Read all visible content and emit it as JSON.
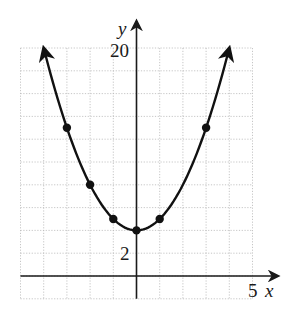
{
  "chart_data": {
    "type": "line",
    "title": "",
    "function": "y = x^2 + 4",
    "xlabel": "x",
    "ylabel": "y",
    "xlim": [
      -5,
      5
    ],
    "ylim": [
      -2,
      20
    ],
    "grid": true,
    "grid_style": "dotted",
    "x_grid_step": 1,
    "y_grid_step": 2,
    "tick_labels": {
      "x": [
        {
          "value": 5,
          "label": "5"
        }
      ],
      "y": [
        {
          "value": 20,
          "label": "20"
        },
        {
          "value": 2,
          "label": "2"
        }
      ]
    },
    "series": [
      {
        "name": "parabola",
        "curve_range": [
          -4,
          4
        ],
        "arrows_at_ends": true,
        "points": [
          {
            "x": -3,
            "y": 13
          },
          {
            "x": -2,
            "y": 8
          },
          {
            "x": -1,
            "y": 5
          },
          {
            "x": 0,
            "y": 4
          },
          {
            "x": 1,
            "y": 5
          },
          {
            "x": 3,
            "y": 13
          }
        ]
      }
    ],
    "legend": null
  },
  "labels": {
    "x_axis": "x",
    "y_axis": "y",
    "x_tick_5": "5",
    "y_tick_20": "20",
    "y_tick_2": "2"
  },
  "colors": {
    "curve": "#111111",
    "axis": "#1a1a1a",
    "grid": "#b8b8b8",
    "background": "#ffffff"
  }
}
